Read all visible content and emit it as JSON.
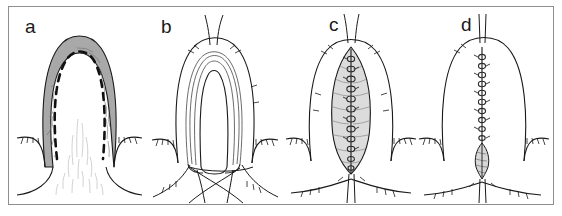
{
  "figure": {
    "kind": "surgical-technique-diagram",
    "panel_count": 4,
    "frame_color": "#8e8e8e",
    "background_color": "#ffffff",
    "ink_color": "#1a1a1a",
    "panels": [
      {
        "id": "a",
        "label": "a",
        "title": "Shaded flap with dashed incision line",
        "shading_color": "#a9a9a9",
        "texture_color": "#7d7d7d",
        "fine_line_color": "#c4c4c4",
        "dashed_line_color": "#111111",
        "elements": [
          "shaded-inverted-u-band",
          "dashed-incision-line",
          "vascular-texture-lines",
          "hair-tick-marks",
          "lower-contour-lines"
        ]
      },
      {
        "id": "b",
        "label": "b",
        "title": "Outlined flap after incision with crossing sutures",
        "shading_color": "none",
        "elements": [
          "outer-contour",
          "inner-contour",
          "double-rail-incision-edges",
          "apex-thread-pair",
          "crossing-suture-strands",
          "hair-tick-marks"
        ]
      },
      {
        "id": "c",
        "label": "c",
        "title": "Lens-shaped defect with running suture line",
        "shading_color": "#dcdcdc",
        "suture_color": "#2a2a2a",
        "elements": [
          "outer-contour",
          "lens-shaped-shaded-defect",
          "running-suture-chain",
          "apex-thread-pair",
          "base-thread-pair",
          "hair-tick-marks",
          "lower-contour-line"
        ]
      },
      {
        "id": "d",
        "label": "d",
        "title": "Closed wound with linear suture and small residual oval",
        "shading_color": "#d7d7d7",
        "suture_color": "#2a2a2a",
        "elements": [
          "outer-contour",
          "vertical-running-suture",
          "residual-shaded-oval",
          "apex-thread-pair",
          "base-thread-pair",
          "hair-tick-marks",
          "lower-contour-line"
        ]
      }
    ]
  }
}
